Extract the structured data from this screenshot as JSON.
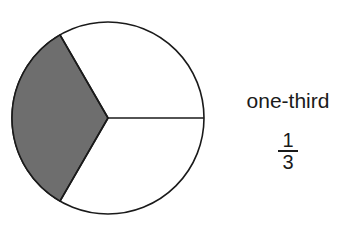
{
  "diagram": {
    "type": "fraction-circle",
    "parts": 3,
    "shaded_parts": 1,
    "shade_color": "#6e6e6e",
    "outline_color": "#1a1a1a",
    "fill_color": "#ffffff"
  },
  "label": {
    "word": "one-third",
    "numerator": "1",
    "denominator": "3"
  }
}
